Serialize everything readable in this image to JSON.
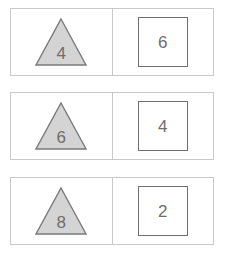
{
  "canvas": {
    "width": 226,
    "height": 260,
    "background_color": "#ffffff"
  },
  "style": {
    "card_border_color": "#c9c9c9",
    "card_background_color": "#ffffff",
    "triangle_fill_color": "#d4d4d4",
    "triangle_stroke_color": "#7a7a7a",
    "square_fill_color": "#ffffff",
    "square_stroke_color": "#6f6f6f",
    "digit_color": "#6e6e6e"
  },
  "rows": [
    {
      "row_index": 1,
      "left": {
        "shape": "triangle",
        "value": "4"
      },
      "right": {
        "shape": "square",
        "value": "6"
      }
    },
    {
      "row_index": 2,
      "left": {
        "shape": "triangle",
        "value": "6"
      },
      "right": {
        "shape": "square",
        "value": "4"
      }
    },
    {
      "row_index": 3,
      "left": {
        "shape": "triangle",
        "value": "8"
      },
      "right": {
        "shape": "square",
        "value": "2"
      }
    }
  ]
}
